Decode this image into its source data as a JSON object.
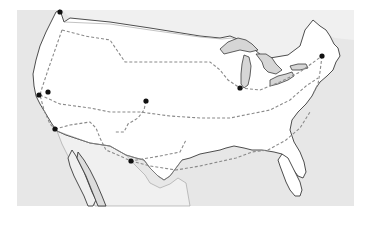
{
  "map": {
    "type": "route-map",
    "region": "United States (contiguous)",
    "colors": {
      "background": "#ffffff",
      "water": "#e6e6e6",
      "land_us": "#ffffff",
      "land_foreign": "#efefef",
      "lakes": "#d6d6d6",
      "coastline": "#3a3a3a",
      "border": "#9a9a9a",
      "route": "#8a8a8a",
      "stop": "#111111"
    },
    "stops": [
      {
        "id": "stop-1",
        "x": 60,
        "y": 12
      },
      {
        "id": "stop-2",
        "x": 39,
        "y": 95
      },
      {
        "id": "stop-3",
        "x": 48,
        "y": 92
      },
      {
        "id": "stop-4",
        "x": 55,
        "y": 129
      },
      {
        "id": "stop-5",
        "x": 146,
        "y": 101
      },
      {
        "id": "stop-6",
        "x": 131,
        "y": 161
      },
      {
        "id": "stop-7",
        "x": 240,
        "y": 88
      },
      {
        "id": "stop-8",
        "x": 322,
        "y": 56
      }
    ]
  }
}
